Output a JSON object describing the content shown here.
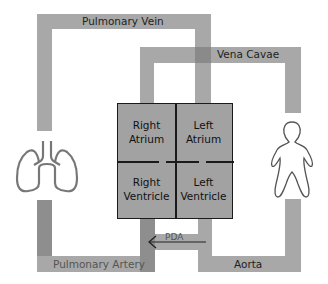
{
  "diagram": {
    "top_caption_cropped": "",
    "vessels": {
      "pulmonary_vein": "Pulmonary Vein",
      "vena_cavae": "Vena Cavae",
      "pulmonary_artery": "Pulmonary Artery",
      "aorta": "Aorta"
    },
    "chambers": {
      "right_atrium": [
        "Right",
        "Atrium"
      ],
      "left_atrium": [
        "Left",
        "Atrium"
      ],
      "right_ventricle": [
        "Right",
        "Ventricle"
      ],
      "left_ventricle": [
        "Left",
        "Ventricle"
      ]
    },
    "shunt": {
      "label": "PDA",
      "direction": "left"
    },
    "icons": {
      "left": "lungs-icon",
      "right": "body-icon"
    },
    "colors": {
      "pipe": "#a8a8a8",
      "pipe_dark": "#8e8e8e",
      "heart": "#a2a2a2",
      "outline": "#1a1a1a"
    }
  }
}
